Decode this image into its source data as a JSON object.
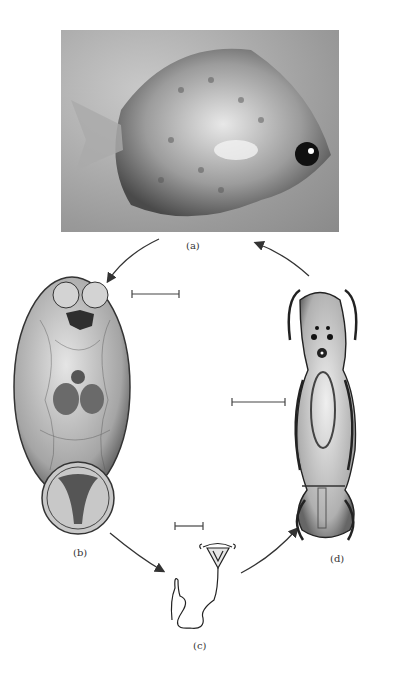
{
  "figure": {
    "panels": [
      {
        "id": "a",
        "label": "(a)",
        "description": "Photograph of a fish"
      },
      {
        "id": "b",
        "label": "(b)",
        "description": "Oval parasite stage with two anterior lobes and posterior disc"
      },
      {
        "id": "c",
        "label": "(c)",
        "description": "Small stage with cup-shaped head and long coiled tail"
      },
      {
        "id": "d",
        "label": "(d)",
        "description": "Elongate ciliated larval stage with eyespots"
      }
    ],
    "cycle_order": [
      "a",
      "b",
      "c",
      "d",
      "a"
    ],
    "scale_bars": 3,
    "colors": {
      "ink": "#333333",
      "background": "#ffffff"
    }
  }
}
